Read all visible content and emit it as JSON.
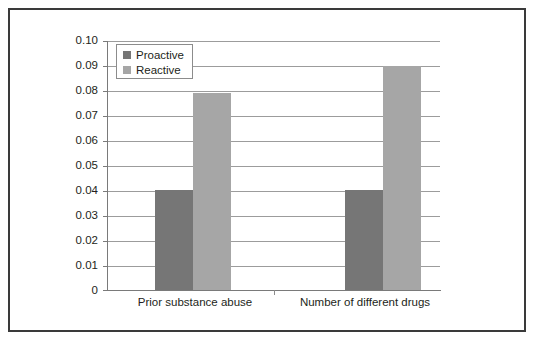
{
  "chart_data": {
    "type": "bar",
    "title": "",
    "xlabel": "",
    "ylabel": "",
    "categories": [
      "Prior substance abuse",
      "Number of different drugs"
    ],
    "series": [
      {
        "name": "Proactive",
        "color": "#767676",
        "values": [
          0.04,
          0.04
        ]
      },
      {
        "name": "Reactive",
        "color": "#a6a6a6",
        "values": [
          0.079,
          0.09
        ]
      }
    ],
    "ylim": [
      0,
      0.1
    ],
    "ytick_values": [
      0.1,
      0.09,
      0.08,
      0.07,
      0.06,
      0.05,
      0.04,
      0.03,
      0.02,
      0.01,
      0
    ],
    "ytick_labels": [
      "0.10",
      "0.09",
      "0.08",
      "0.07",
      "0.06",
      "0.05",
      "0.04",
      "0.03",
      "0.02",
      "0.01",
      "0"
    ],
    "grid": true,
    "legend_position": "top-left-inside",
    "legend_entries": [
      "Proactive",
      "Reactive"
    ]
  },
  "legend": {
    "proactive_label": "Proactive",
    "reactive_label": "Reactive"
  },
  "yaxis": {
    "t0": "0.10",
    "t1": "0.09",
    "t2": "0.08",
    "t3": "0.07",
    "t4": "0.06",
    "t5": "0.05",
    "t6": "0.04",
    "t7": "0.03",
    "t8": "0.02",
    "t9": "0.01",
    "t10": "0"
  },
  "xaxis": {
    "cat0": "Prior substance abuse",
    "cat1": "Number of different drugs"
  },
  "colors": {
    "proactive": "#767676",
    "reactive": "#a6a6a6",
    "frame": "#3a3a3a",
    "gridline": "#9c9c9c",
    "background": "#ffffff"
  }
}
